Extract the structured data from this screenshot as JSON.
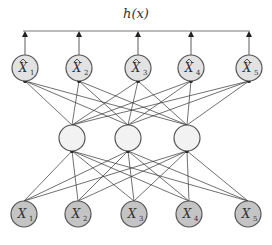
{
  "diagram": {
    "title": "h(x)",
    "type": "autoencoder-network",
    "layers": {
      "output": {
        "label": "reconstructed outputs",
        "nodes": [
          {
            "symbol": "X̂",
            "sub": "1"
          },
          {
            "symbol": "X̂",
            "sub": "2"
          },
          {
            "symbol": "X̂",
            "sub": "3"
          },
          {
            "symbol": "X̂",
            "sub": "4"
          },
          {
            "symbol": "X̂",
            "sub": "5"
          }
        ]
      },
      "hidden": {
        "label": "hidden units",
        "count": 3
      },
      "input": {
        "label": "inputs",
        "nodes": [
          {
            "symbol": "X",
            "sub": "1"
          },
          {
            "symbol": "X",
            "sub": "2"
          },
          {
            "symbol": "X",
            "sub": "3"
          },
          {
            "symbol": "X",
            "sub": "4"
          },
          {
            "symbol": "X",
            "sub": "5"
          }
        ]
      }
    },
    "colors": {
      "input_fill": "#c4c4c4",
      "hidden_fill": "#f2f2f2",
      "output_fill": "#e2e2e2",
      "stroke": "#555555"
    }
  }
}
